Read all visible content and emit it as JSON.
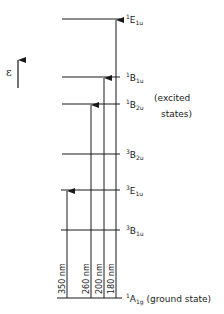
{
  "diagram": {
    "type": "energy-level-diagram",
    "axis_label": "ε",
    "line_color": "#1a1a1a",
    "levels": [
      {
        "mult": "1",
        "sym": "E",
        "sub": "1u",
        "y": 19,
        "note": ""
      },
      {
        "mult": "1",
        "sym": "B",
        "sub": "1u",
        "y": 77,
        "note": ""
      },
      {
        "mult": "1",
        "sym": "B",
        "sub": "2u",
        "y": 104,
        "note": ""
      },
      {
        "mult": "3",
        "sym": "B",
        "sub": "2u",
        "y": 154,
        "note": ""
      },
      {
        "mult": "3",
        "sym": "E",
        "sub": "1u",
        "y": 190,
        "note": ""
      },
      {
        "mult": "3",
        "sym": "B",
        "sub": "1u",
        "y": 230,
        "note": ""
      },
      {
        "mult": "1",
        "sym": "A",
        "sub": "1g",
        "y": 298,
        "note": "(ground state)"
      }
    ],
    "group_label_line1": "(excited",
    "group_label_line2": "states)",
    "transitions": [
      {
        "label": "350 nm",
        "to": "3E1u",
        "x": 67
      },
      {
        "label": "260 nm",
        "to": "1B2u",
        "x": 91
      },
      {
        "label": "200 nm",
        "to": "1B1u",
        "x": 104
      },
      {
        "label": "180 nm",
        "to": "1E1u",
        "x": 116
      }
    ]
  }
}
